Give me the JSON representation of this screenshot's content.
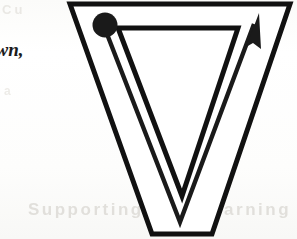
{
  "page": {
    "width": 297,
    "height": 239,
    "background_color": "#fdfdfb",
    "ink_color": "#111111"
  },
  "margin_text": {
    "line1": "own,",
    "line2": "p"
  },
  "ghost_text": {
    "bottom": "Supporting your learning",
    "top_left": "Cu",
    "mid_left": "a"
  },
  "glyph": {
    "letter": "V",
    "outline_color": "#111111",
    "outline_width": 5,
    "fill_color": "#ffffff",
    "outer_path": "M 70,4 L 290,4 L 212,234 L 152,234 Z",
    "inner_path": "M 118,28 L 238,28 L 182,196 Z",
    "description": "double-outline capital letter V"
  },
  "stroke_order": {
    "start_dot": {
      "label": "stroke-start-dot",
      "cx": 105,
      "cy": 25,
      "r": 12.5,
      "color": "#1a1a1a"
    },
    "path": {
      "label": "stroke-direction-path",
      "d": "M 107,34 L 180,222 L 254,24",
      "color": "#1a1a1a",
      "width": 4.4
    },
    "arrow_head": {
      "label": "stroke-end-arrowhead",
      "tip_x": 259,
      "tip_y": 13,
      "points": "259,13 246,47 253,43 261,49",
      "color": "#1a1a1a"
    },
    "stroke_count": 1,
    "direction": "down-then-up"
  },
  "icons": {
    "start_dot": "filled-circle-icon",
    "arrow": "arrow-up-right-icon"
  }
}
